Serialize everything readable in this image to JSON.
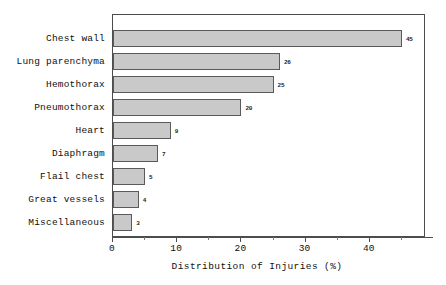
{
  "chart_data": {
    "type": "bar",
    "orientation": "horizontal",
    "title": "",
    "xlabel": "Distribution of Injuries (%)",
    "ylabel": "",
    "xlim": [
      0,
      50
    ],
    "grid": false,
    "legend": null,
    "xticks": [
      0,
      10,
      20,
      30,
      40
    ],
    "xtick_labels": [
      "0",
      "10",
      "20",
      "30",
      "40"
    ],
    "xminor_ticks": [
      5,
      15,
      25,
      35,
      45
    ],
    "categories": [
      "Chest wall",
      "Lung parenchyma",
      "Hemothorax",
      "Pneumothorax",
      "Heart",
      "Diaphragm",
      "Flail chest",
      "Great vessels",
      "Miscellaneous"
    ],
    "values": [
      45,
      26,
      25,
      20,
      9,
      7,
      5,
      4,
      3
    ],
    "value_labels": [
      "45",
      "26",
      "25",
      "20",
      "9",
      "7",
      "5",
      "4",
      "3"
    ],
    "bar_color": "#c9c9c9",
    "bar_edge_color": "#5a5a5a",
    "frame_color": "#4d4d4d",
    "text_color": "#101010",
    "background_color": "#ffffff"
  }
}
